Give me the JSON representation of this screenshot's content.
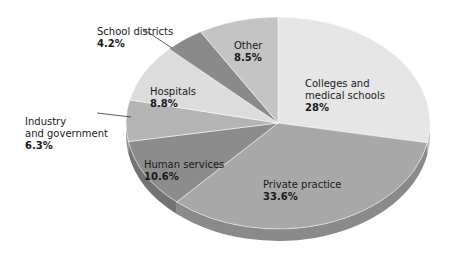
{
  "chart_data": {
    "type": "pie",
    "title": "",
    "style": "3d-pie",
    "categories": [
      "Colleges and medical schools",
      "Private practice",
      "Human services",
      "Industry and government",
      "Hospitals",
      "School districts",
      "Other"
    ],
    "values": [
      28,
      33.6,
      10.6,
      6.3,
      8.8,
      4.2,
      8.5
    ],
    "value_labels": [
      "28%",
      "33.6%",
      "10.6%",
      "6.3%",
      "8.8%",
      "4.2%",
      "8.5%"
    ],
    "colors": [
      "#e6e6e6",
      "#a8a8a8",
      "#8c8c8c",
      "#b4b4b4",
      "#dcdcdc",
      "#8a8a8a",
      "#c4c4c4"
    ],
    "legend": "none (direct labels)"
  },
  "labels": {
    "colleges": {
      "name": "Colleges and\nmedical schools",
      "pct": "28%"
    },
    "private": {
      "name": "Private practice",
      "pct": "33.6%"
    },
    "human": {
      "name": "Human services",
      "pct": "10.6%"
    },
    "industry": {
      "name": "Industry\nand government",
      "pct": "6.3%"
    },
    "hospitals": {
      "name": "Hospitals",
      "pct": "8.8%"
    },
    "school": {
      "name": "School districts",
      "pct": "4.2%"
    },
    "other": {
      "name": "Other",
      "pct": "8.5%"
    }
  }
}
